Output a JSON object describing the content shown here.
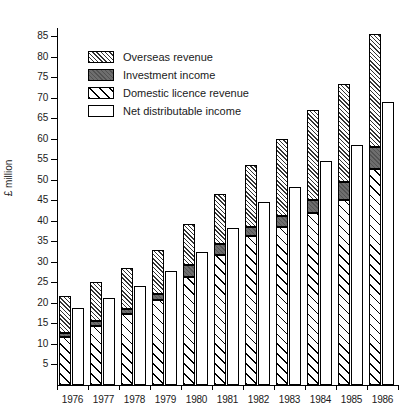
{
  "chart_data": {
    "type": "bar",
    "title": "",
    "xlabel": "",
    "ylabel": "£ million",
    "ylim": [
      0,
      87
    ],
    "ytick_values": [
      5,
      10,
      15,
      20,
      25,
      30,
      35,
      40,
      45,
      50,
      55,
      60,
      65,
      70,
      75,
      80,
      85
    ],
    "ytick_labels": [
      "5",
      "10",
      "15",
      "20",
      "25",
      "30",
      "35",
      "40",
      "45",
      "50",
      "55",
      "60",
      "65",
      "70",
      "75",
      "80",
      "85"
    ],
    "grid": false,
    "legend_position": "upper-left inside",
    "categories": [
      "1976",
      "1977",
      "1978",
      "1979",
      "1980",
      "1981",
      "1982",
      "1983",
      "1984",
      "1985",
      "1986"
    ],
    "legend": [
      {
        "name": "Overseas revenue",
        "pattern": "dense-diagonal-hatch"
      },
      {
        "name": "Investment income",
        "pattern": "solid-dark-grey"
      },
      {
        "name": "Domestic licence revenue",
        "pattern": "wide-diagonal-hatch"
      },
      {
        "name": "Net distributable income",
        "pattern": "white-outline"
      }
    ],
    "series": [
      {
        "name": "Domestic licence revenue",
        "stack": "revenue",
        "values": [
          11.6,
          14.4,
          17.4,
          20.6,
          26.3,
          31.7,
          36.2,
          38.4,
          41.8,
          45.2,
          52.6
        ]
      },
      {
        "name": "Investment income",
        "stack": "revenue",
        "values": [
          1.0,
          1.2,
          1.1,
          1.6,
          3.0,
          2.7,
          2.3,
          2.8,
          3.4,
          4.2,
          5.3
        ]
      },
      {
        "name": "Overseas revenue",
        "stack": "revenue",
        "values": [
          9.1,
          9.4,
          10.1,
          10.8,
          10.0,
          12.1,
          15.2,
          18.8,
          21.8,
          24.0,
          27.6
        ]
      },
      {
        "name": "Net distributable income",
        "stack": "net",
        "values": [
          18.8,
          21.3,
          24.1,
          27.7,
          32.5,
          38.3,
          44.5,
          48.3,
          54.5,
          58.4,
          68.9
        ]
      }
    ],
    "stack_totals": [
      21.7,
      25.0,
      28.6,
      33.0,
      39.3,
      46.5,
      53.7,
      60.0,
      67.0,
      73.4,
      85.5
    ]
  }
}
